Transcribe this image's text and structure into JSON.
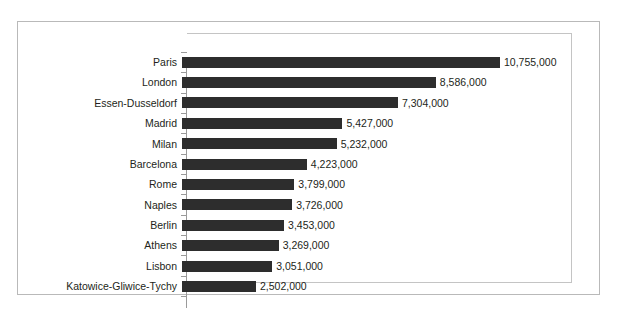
{
  "chart_data": {
    "type": "bar",
    "orientation": "horizontal",
    "title": "",
    "subtitle": "",
    "xlabel": "",
    "ylabel": "",
    "grid": false,
    "legend": false,
    "legend_position": "none",
    "axis_range": [
      0,
      10755000
    ],
    "bar_color": "#2d2d2d",
    "frame_color": "#b9b9b9",
    "axis_color": "#9a9a9a",
    "text_color": "#231f20",
    "categories": [
      "Paris",
      "London",
      "Essen-Dusseldorf",
      "Madrid",
      "Milan",
      "Barcelona",
      "Rome",
      "Naples",
      "Berlin",
      "Athens",
      "Lisbon",
      "Katowice-Gliwice-Tychy"
    ],
    "values": [
      10755000,
      8586000,
      7304000,
      5427000,
      5232000,
      4223000,
      3799000,
      3726000,
      3453000,
      3269000,
      3051000,
      2502000
    ],
    "value_labels": [
      "10,755,000",
      "8,586,000",
      "7,304,000",
      "5,427,000",
      "5,232,000",
      "4,223,000",
      "3,799,000",
      "3,726,000",
      "3,453,000",
      "3,269,000",
      "3,051,000",
      "2,502,000"
    ],
    "rows": [
      {
        "category": "Paris",
        "value": 10755000,
        "label": "10,755,000"
      },
      {
        "category": "London",
        "value": 8586000,
        "label": "8,586,000"
      },
      {
        "category": "Essen-Dusseldorf",
        "value": 7304000,
        "label": "7,304,000"
      },
      {
        "category": "Madrid",
        "value": 5427000,
        "label": "5,427,000"
      },
      {
        "category": "Milan",
        "value": 5232000,
        "label": "5,232,000"
      },
      {
        "category": "Barcelona",
        "value": 4223000,
        "label": "4,223,000"
      },
      {
        "category": "Rome",
        "value": 3799000,
        "label": "3,799,000"
      },
      {
        "category": "Naples",
        "value": 3726000,
        "label": "3,726,000"
      },
      {
        "category": "Berlin",
        "value": 3453000,
        "label": "3,453,000"
      },
      {
        "category": "Athens",
        "value": 3269000,
        "label": "3,269,000"
      },
      {
        "category": "Lisbon",
        "value": 3051000,
        "label": "3,051,000"
      },
      {
        "category": "Katowice-Gliwice-Tychy",
        "value": 2502000,
        "label": "2,502,000"
      }
    ]
  }
}
